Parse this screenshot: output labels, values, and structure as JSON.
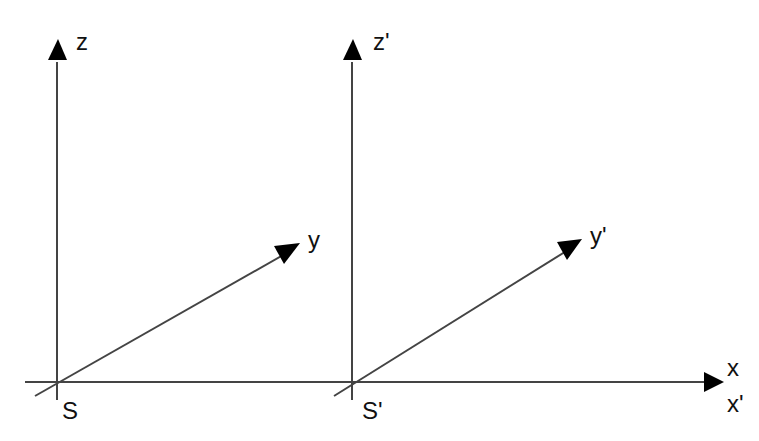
{
  "diagram": {
    "type": "coordinate-frames",
    "colors": {
      "line": "#444444",
      "arrow": "#000000",
      "text": "#111111",
      "background": "#ffffff"
    },
    "frames": [
      {
        "name": "S",
        "origin_label": "S",
        "axes": {
          "z": "z",
          "y": "y"
        }
      },
      {
        "name": "S'",
        "origin_label": "S'",
        "axes": {
          "z": "z'",
          "y": "y'"
        }
      }
    ],
    "shared_axis": {
      "x": "x",
      "x_prime": "x'"
    }
  }
}
